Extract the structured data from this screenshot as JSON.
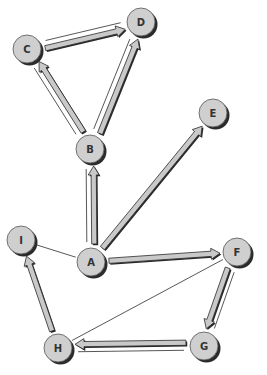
{
  "diagram": {
    "type": "directed-graph",
    "colors": {
      "background": "#ffffff",
      "node_fill": "#cfcfcf",
      "node_shadow": "#2b2b2b",
      "node_stroke": "#555555",
      "arrow_fill": "#c9c9c9",
      "arrow_stroke": "#2a2a2a",
      "thin_line": "#444444",
      "label": "#333333"
    },
    "nodes": [
      {
        "id": "A",
        "label": "A",
        "x": 91,
        "y": 262
      },
      {
        "id": "B",
        "label": "B",
        "x": 90,
        "y": 149
      },
      {
        "id": "C",
        "label": "C",
        "x": 27,
        "y": 49
      },
      {
        "id": "D",
        "label": "D",
        "x": 141,
        "y": 22
      },
      {
        "id": "E",
        "label": "E",
        "x": 213,
        "y": 113
      },
      {
        "id": "F",
        "label": "F",
        "x": 237,
        "y": 252
      },
      {
        "id": "G",
        "label": "G",
        "x": 204,
        "y": 346
      },
      {
        "id": "H",
        "label": "H",
        "x": 58,
        "y": 348
      },
      {
        "id": "I",
        "label": "I",
        "x": 21,
        "y": 240
      }
    ],
    "arrows": [
      {
        "from": "C",
        "to": "D",
        "thin_pair": true
      },
      {
        "from": "B",
        "to": "C",
        "thin_pair": true
      },
      {
        "from": "B",
        "to": "D",
        "thin_pair": true
      },
      {
        "from": "A",
        "to": "B",
        "thin_pair": true
      },
      {
        "from": "A",
        "to": "E",
        "thin_pair": false
      },
      {
        "from": "A",
        "to": "F",
        "thin_pair": false
      },
      {
        "from": "F",
        "to": "G",
        "thin_pair": true
      },
      {
        "from": "G",
        "to": "H",
        "thin_pair": true
      },
      {
        "from": "H",
        "to": "I",
        "thin_pair": false
      }
    ],
    "lines": [
      {
        "from": "A",
        "to": "I"
      },
      {
        "from": "H",
        "to": "F"
      }
    ]
  }
}
